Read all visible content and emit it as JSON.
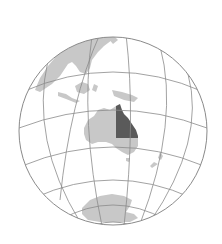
{
  "map": {
    "type": "orthographic-locator-globe",
    "highlighted_region": "Queensland",
    "context_region": "Australia",
    "colors": {
      "background": "#ffffff",
      "ocean": "#ffffff",
      "land": "#c8c8c8",
      "highlight": "#5a5a5a",
      "graticule": "#8a8a8a",
      "outline": "#8a8a8a"
    },
    "globe": {
      "cx": 113,
      "cy": 131,
      "r": 94
    },
    "landmasses": [
      "Asia",
      "Maritime Southeast Asia",
      "New Guinea",
      "Australia",
      "New Zealand",
      "Antarctica"
    ]
  }
}
